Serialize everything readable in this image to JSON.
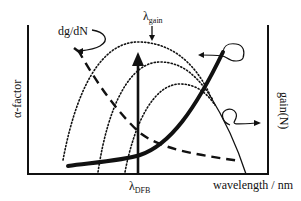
{
  "diagram": {
    "type": "schematic-plot",
    "labels": {
      "y_left": "α-factor",
      "y_right": "gain(N)",
      "x_axis": "wavelength / nm",
      "lambda_gain_main": "λ",
      "lambda_gain_sub": "gain",
      "lambda_dfb_main": "λ",
      "lambda_dfb_sub": "DFB",
      "dg_dN": "dg/dN"
    },
    "curves": [
      {
        "name": "alpha-factor",
        "style": "bold solid",
        "description": "rises with wavelength"
      },
      {
        "name": "dg/dN",
        "style": "dashed",
        "description": "decreases with wavelength"
      },
      {
        "name": "gain(N) outer",
        "style": "dotted",
        "description": "gain spectrum, highest carrier density"
      },
      {
        "name": "gain(N) middle",
        "style": "dotted",
        "description": "gain spectrum, medium carrier density"
      },
      {
        "name": "gain(N) inner",
        "style": "dotted",
        "description": "gain spectrum, lowest carrier density"
      },
      {
        "name": "gain right edge",
        "style": "thin solid"
      }
    ],
    "markers": [
      {
        "name": "lambda-DFB",
        "style": "vertical arrow"
      },
      {
        "name": "lambda-gain",
        "style": "small down arrow at gain peak"
      }
    ],
    "colors": {
      "ink": "#111111",
      "background": "#ffffff"
    }
  }
}
